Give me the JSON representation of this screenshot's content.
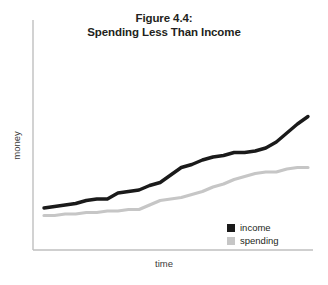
{
  "chart_data": {
    "type": "line",
    "title": "Figure 4.4:\nSpending Less Than Income",
    "title_lines": [
      "Figure 4.4:",
      "Spending Less Than Income"
    ],
    "xlabel": "time",
    "ylabel": "money",
    "grid": false,
    "legend_position": "bottom-right",
    "xlim": [
      0,
      100
    ],
    "ylim": [
      0,
      100
    ],
    "axis_ticks": {
      "x": [],
      "y": []
    },
    "x": [
      0,
      4,
      8,
      12,
      16,
      20,
      24,
      28,
      32,
      36,
      40,
      44,
      48,
      52,
      56,
      60,
      64,
      68,
      72,
      76,
      80,
      84,
      88,
      92,
      96,
      100
    ],
    "series": [
      {
        "name": "income",
        "color": "#1a1a1a",
        "values": [
          28,
          29,
          30,
          31,
          33,
          34,
          34,
          38,
          39,
          40,
          43,
          45,
          50,
          55,
          57,
          60,
          62,
          63,
          65,
          65,
          66,
          68,
          72,
          78,
          84,
          89
        ]
      },
      {
        "name": "spending",
        "color": "#c6c6c6",
        "values": [
          23,
          23,
          24,
          24,
          25,
          25,
          26,
          26,
          27,
          27,
          30,
          33,
          34,
          35,
          37,
          39,
          42,
          44,
          47,
          49,
          51,
          52,
          52,
          54,
          55,
          55
        ]
      }
    ],
    "legend": [
      {
        "label": "income",
        "color": "#1a1a1a"
      },
      {
        "label": "spending",
        "color": "#c6c6c6"
      }
    ],
    "colors": {
      "background": "#ffffff",
      "axis": "#bfbfbf",
      "income": "#1a1a1a",
      "spending": "#c6c6c6",
      "text": "#231f20"
    }
  }
}
